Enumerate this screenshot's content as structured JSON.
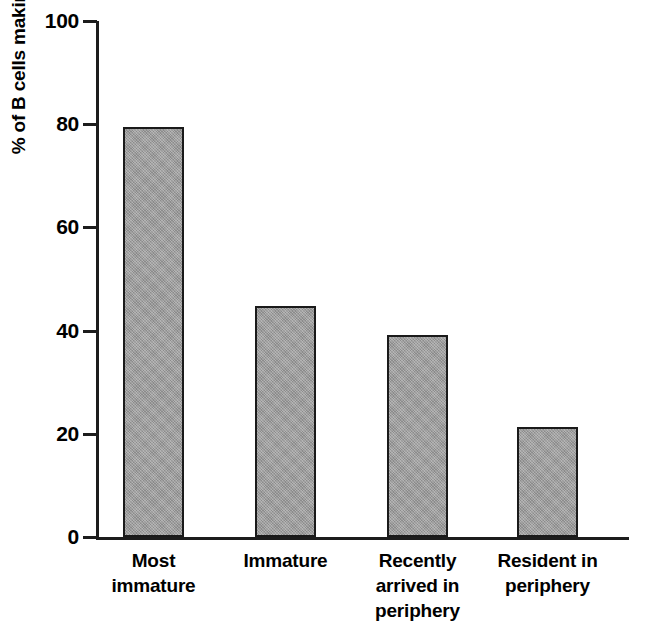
{
  "chart_data": {
    "type": "bar",
    "title": "",
    "subtitle": "",
    "xlabel": "",
    "ylabel": "% of B cells making autoantibody",
    "ylim": [
      0,
      100
    ],
    "yticks": [
      0,
      20,
      40,
      60,
      80,
      100
    ],
    "ytick_labels": [
      "0",
      "20",
      "40",
      "60",
      "80",
      "100"
    ],
    "grid": false,
    "legend": false,
    "legend_position": "none",
    "categories": [
      "Most immature",
      "Immature",
      "Recently arrived in periphery",
      "Resident in periphery"
    ],
    "category_lines": [
      [
        "Most",
        "immature"
      ],
      [
        "Immature"
      ],
      [
        "Recently",
        "arrived in",
        "periphery"
      ],
      [
        "Resident in",
        "periphery"
      ]
    ],
    "values": [
      79.5,
      44.8,
      39.1,
      21.3
    ],
    "bar_color": "#9c9c9c",
    "bar_edge_color": "#1a1a1a",
    "axis_color": "#1d1d1d"
  }
}
